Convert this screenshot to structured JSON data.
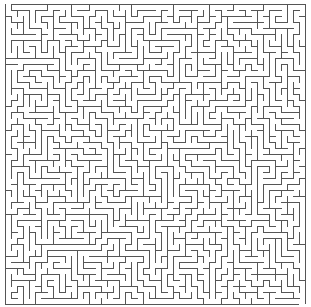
{
  "maze": {
    "cols": 50,
    "rows": 50,
    "cell_size": 6,
    "origin_x": 5,
    "origin_y": 4,
    "wall_color": "#555555",
    "background": "#ffffff",
    "wall_width": 1,
    "seed": 7,
    "entrance": {
      "side": "top",
      "col": 0
    },
    "exit": {
      "side": "bottom",
      "col": 49
    }
  }
}
